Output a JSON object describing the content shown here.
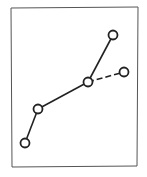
{
  "diagram": {
    "type": "node-link tree",
    "frame": {
      "x1": 11,
      "y1": 7,
      "x2": 138,
      "y2": 167,
      "stroke": "#555555"
    },
    "style": {
      "line_color": "#222222",
      "node_fill": "#ffffff",
      "node_radius": 4.5
    },
    "nodes": [
      {
        "id": "A",
        "x": 25,
        "y": 143
      },
      {
        "id": "B",
        "x": 38,
        "y": 109
      },
      {
        "id": "C",
        "x": 88,
        "y": 82
      },
      {
        "id": "D",
        "x": 113,
        "y": 35
      },
      {
        "id": "E",
        "x": 124,
        "y": 72
      }
    ],
    "edges": [
      {
        "from": "A",
        "to": "B",
        "style": "solid"
      },
      {
        "from": "B",
        "to": "C",
        "style": "solid"
      },
      {
        "from": "C",
        "to": "D",
        "style": "solid"
      },
      {
        "from": "C",
        "to": "E",
        "style": "dashed"
      }
    ]
  }
}
